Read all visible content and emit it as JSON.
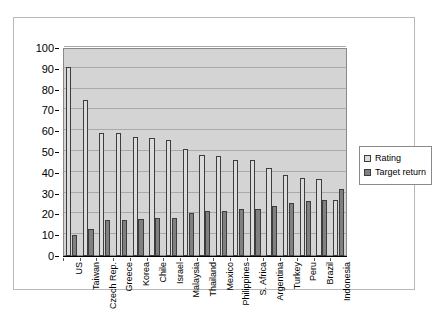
{
  "chart_data": {
    "type": "bar",
    "title": "",
    "subtitle": "",
    "xlabel": "",
    "ylabel": "",
    "ylim": [
      0,
      100
    ],
    "ytick_step": 10,
    "yticks": [
      0,
      10,
      20,
      30,
      40,
      50,
      60,
      70,
      80,
      90,
      100
    ],
    "grid": true,
    "legend_position": "right",
    "categories": [
      "US",
      "Taiwan",
      "Czech Rep.",
      "Greece",
      "Korea",
      "Chile",
      "Israel",
      "Malaysia",
      "Thailand",
      "Mexico",
      "Philippines",
      "S. Africa",
      "Argentina",
      "Turkey",
      "Peru",
      "Brazil",
      "Indonesia"
    ],
    "series": [
      {
        "name": "Rating",
        "color": "#dcdcdc",
        "values": [
          91,
          75,
          59,
          59,
          57,
          56.5,
          56,
          51.5,
          48.5,
          48,
          46,
          46,
          42.5,
          39,
          37.5,
          37,
          27
        ]
      },
      {
        "name": "Target return",
        "color": "#808080",
        "values": [
          10,
          13,
          17.5,
          17.5,
          18,
          18.5,
          18.5,
          20.5,
          21.5,
          21.5,
          22.5,
          22.5,
          24,
          25.5,
          26.5,
          27,
          32
        ]
      }
    ]
  },
  "legend": {
    "items": [
      {
        "label": "Rating",
        "swatch": "rating"
      },
      {
        "label": "Target return",
        "swatch": "target"
      }
    ]
  }
}
